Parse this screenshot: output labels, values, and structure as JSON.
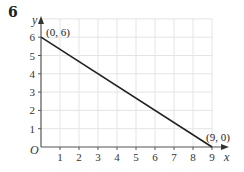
{
  "question_number": "6",
  "chart_data": {
    "type": "line",
    "title": "",
    "xlabel": "x",
    "ylabel": "y",
    "origin_label": "O",
    "xlim": [
      0,
      9.5
    ],
    "ylim": [
      0,
      7
    ],
    "x_ticks": [
      "1",
      "2",
      "3",
      "4",
      "5",
      "6",
      "7",
      "8",
      "9"
    ],
    "y_ticks": [
      "1",
      "2",
      "3",
      "4",
      "5",
      "6"
    ],
    "grid": true,
    "series": [
      {
        "name": "line",
        "x": [
          0,
          9
        ],
        "y": [
          6,
          0
        ],
        "color": "#222222"
      }
    ],
    "annotations": [
      {
        "text": "(0, 6)",
        "x": 0,
        "y": 6
      },
      {
        "text": "(9, 0)",
        "x": 9,
        "y": 0
      }
    ]
  }
}
